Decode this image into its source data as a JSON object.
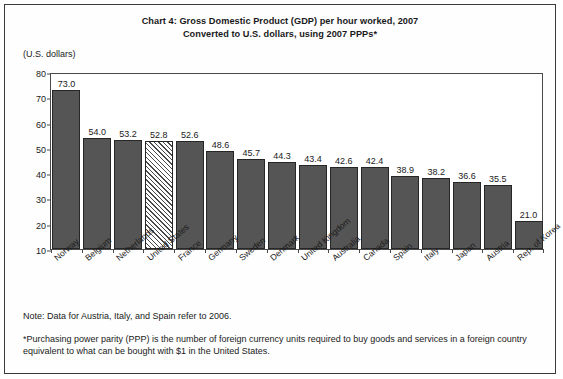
{
  "chart_data": {
    "type": "bar",
    "title": "Chart 4: Gross Domestic Product (GDP) per hour worked, 2007",
    "subtitle": "Converted to U.S. dollars, using 2007 PPPs*",
    "ylabel": "(U.S. dollars)",
    "xlabel": "",
    "ylim": [
      10,
      80
    ],
    "yticks": [
      10,
      20,
      30,
      40,
      50,
      60,
      70,
      80
    ],
    "ytick_labels": [
      "10",
      "20",
      "30",
      "40",
      "50",
      "60",
      "70",
      "80"
    ],
    "grid": false,
    "legend": "none",
    "categories": [
      "Norway",
      "Belgium",
      "Netherlands",
      "United States",
      "France",
      "Germany",
      "Sweden",
      "Denmark",
      "United Kingdom",
      "Australia",
      "Canada",
      "Spain",
      "Italy",
      "Japan",
      "Austria",
      "Rep. of Korea"
    ],
    "values": [
      73.0,
      54.0,
      53.2,
      52.8,
      52.6,
      48.6,
      45.7,
      44.3,
      43.4,
      42.6,
      42.4,
      38.9,
      38.2,
      36.6,
      35.5,
      21.0
    ],
    "value_labels": [
      "73.0",
      "54.0",
      "53.2",
      "52.8",
      "52.6",
      "48.6",
      "45.7",
      "44.3",
      "43.4",
      "42.6",
      "42.4",
      "38.9",
      "38.2",
      "36.6",
      "35.5",
      "21.0"
    ],
    "highlighted_category": "United States",
    "bar_styles": [
      "solid",
      "solid",
      "solid",
      "hatched",
      "solid",
      "solid",
      "solid",
      "solid",
      "solid",
      "solid",
      "solid",
      "solid",
      "solid",
      "solid",
      "solid",
      "solid"
    ],
    "colors": {
      "bar_fill": "#555555",
      "bar_edge": "#262626",
      "hatch_line": "#4a4a4a",
      "hatch_background": "#ffffff",
      "axis": "#4a4a4a",
      "text": "#1a1a1a",
      "background": "#ffffff"
    }
  },
  "notes": {
    "note": "Note: Data for Austria, Italy, and Spain refer to 2006.",
    "footnote": "*Purchasing power parity (PPP) is the number of foreign currency units required to buy goods and services in a foreign country equivalent to what can be bought with $1 in the United States."
  }
}
